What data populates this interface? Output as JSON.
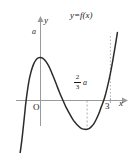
{
  "figure": {
    "caption_label": "y=f(x)",
    "axis_y_label": "y",
    "axis_x_label": "x",
    "origin_label": "O",
    "peak_label": "a",
    "tick_x_3": "3",
    "min_value_numerator": "2",
    "min_value_denominator": "3",
    "min_value_symbol": "a",
    "colors": {
      "curve": "#2b2b2b",
      "axis": "#9a9a9a",
      "guide": "#9a9a9a",
      "text": "#1a1a1a",
      "background": "#ffffff"
    }
  },
  "chart_data": {
    "type": "line",
    "title": "",
    "xlabel": "x",
    "ylabel": "y",
    "legend": [
      "y=f(x)"
    ],
    "grid": false,
    "legend_position": "top-right",
    "xlim": [
      -0.9,
      3.55
    ],
    "ylim": [
      -1.35,
      1.75
    ],
    "annotations": [
      {
        "text": "a",
        "x": 0,
        "y": 1.0,
        "note": "local maximum value on y-axis"
      },
      {
        "text": "2/3 a",
        "x": 2,
        "y": 0.28,
        "note": "label near x=2 dashed guide line"
      },
      {
        "text": "3",
        "x": 3,
        "y": 0,
        "note": "x-axis tick"
      },
      {
        "text": "O",
        "x": 0,
        "y": 0,
        "note": "origin"
      },
      {
        "text": "y=f(x)",
        "x": 2.35,
        "y": 1.55,
        "note": "curve label"
      }
    ],
    "guide_lines": [
      {
        "orientation": "vertical",
        "x": 2,
        "style": "dashed",
        "from_y": 0,
        "to_y": -0.67
      },
      {
        "orientation": "vertical",
        "x": 3,
        "style": "dotted",
        "from_y": 0,
        "to_y": 1.55
      }
    ],
    "features": {
      "local_maximum": {
        "x": 0,
        "y": 1.0,
        "label": "a"
      },
      "local_minimum": {
        "x": 2,
        "y": -0.67,
        "label": ""
      },
      "x_intercepts": [
        -0.62,
        1.25,
        2.72
      ]
    },
    "series": [
      {
        "name": "y=f(x)",
        "x": [
          -0.9,
          -0.8,
          -0.7,
          -0.62,
          -0.5,
          -0.4,
          -0.3,
          -0.2,
          -0.1,
          0.0,
          0.1,
          0.2,
          0.3,
          0.4,
          0.5,
          0.6,
          0.7,
          0.8,
          0.9,
          1.0,
          1.1,
          1.25,
          1.4,
          1.5,
          1.6,
          1.7,
          1.8,
          1.9,
          2.0,
          2.1,
          2.2,
          2.3,
          2.4,
          2.5,
          2.6,
          2.72,
          2.8,
          2.9,
          3.0,
          3.1,
          3.2,
          3.3
        ],
        "y": [
          -1.32,
          -0.92,
          -0.42,
          -0.01,
          0.44,
          0.68,
          0.84,
          0.94,
          0.99,
          1.0,
          0.98,
          0.93,
          0.85,
          0.75,
          0.62,
          0.49,
          0.35,
          0.21,
          0.08,
          -0.04,
          -0.16,
          -0.31,
          -0.45,
          -0.52,
          -0.58,
          -0.63,
          -0.66,
          -0.67,
          -0.67,
          -0.65,
          -0.6,
          -0.53,
          -0.43,
          -0.31,
          -0.16,
          0.01,
          0.16,
          0.38,
          0.63,
          0.92,
          1.24,
          1.58
        ]
      }
    ]
  }
}
